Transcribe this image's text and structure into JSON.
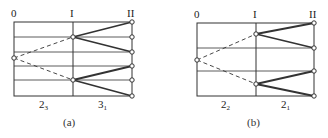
{
  "panels": [
    {
      "id": "a",
      "caption": "(a)",
      "axis_labels": {
        "left": "0",
        "mid": "I",
        "right": "II"
      },
      "segment_labels": [
        {
          "base": "2",
          "sub": "3"
        },
        {
          "base": "3",
          "sub": "1"
        }
      ]
    },
    {
      "id": "b",
      "caption": "(b)",
      "axis_labels": {
        "left": "0",
        "mid": "I",
        "right": "II"
      },
      "segment_labels": [
        {
          "base": "2",
          "sub": "2"
        },
        {
          "base": "2",
          "sub": "1"
        }
      ]
    }
  ],
  "colors": {
    "line": "#333333",
    "background": "#ffffff"
  }
}
